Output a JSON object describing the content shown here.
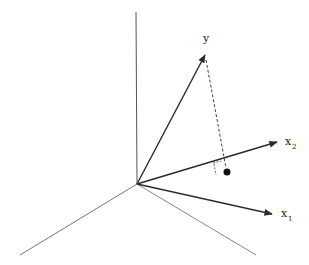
{
  "diagram": {
    "labels": {
      "y": "y",
      "x2_base": "x",
      "x2_sub": "2",
      "x1_base": "x",
      "x1_sub": "1"
    },
    "colors": {
      "vector": "#2a2a2a",
      "axis": "#555555",
      "dashed": "#444444",
      "point": "#111111"
    }
  }
}
